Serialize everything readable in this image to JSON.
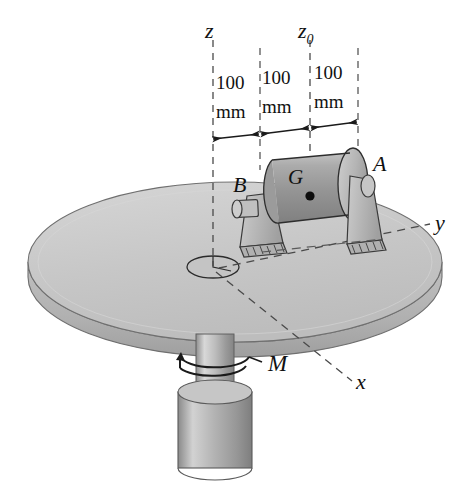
{
  "figure": {
    "axes": {
      "z_label": "z",
      "z0_label": "z",
      "z0_subscript": "0",
      "x_label": "x",
      "y_label": "y"
    },
    "dimensions": [
      {
        "value": "100",
        "unit": "mm"
      },
      {
        "value": "100",
        "unit": "mm"
      },
      {
        "value": "100",
        "unit": "mm"
      }
    ],
    "points": {
      "bearing_b": "B",
      "bearing_a": "A",
      "center_of_mass": "G"
    },
    "moment_label": "M",
    "colors": {
      "disk_fill": "#c9c9c9",
      "disk_edge": "#b3b3b3",
      "rotor_fill": "#9e9e9e",
      "bracket_fill": "#b8b8b8",
      "shaft_fill": "#b5b5b5",
      "line": "#1a1a1a",
      "dashed": "#555555",
      "background": "#ffffff"
    }
  }
}
